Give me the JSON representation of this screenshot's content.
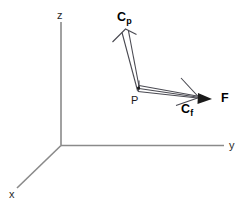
{
  "figure": {
    "title": "",
    "background_color": "#ffffff",
    "axis_color": "#8a8a8a",
    "vector_color": "#4a4a52",
    "label_color": "#111111"
  },
  "axes": [
    {
      "id": "z",
      "label": "z",
      "direction": "up"
    },
    {
      "id": "y",
      "label": "y",
      "direction": "right"
    },
    {
      "id": "x",
      "label": "x",
      "direction": "down-left"
    }
  ],
  "points": [
    {
      "id": "P",
      "label": "P"
    }
  ],
  "vectors": [
    {
      "id": "Cp",
      "label": "C",
      "subscript": "p",
      "head_style": "open",
      "direction": "up-left"
    },
    {
      "id": "Cf",
      "label": "C",
      "subscript": "f",
      "head_style": "open",
      "direction": "right"
    },
    {
      "id": "F",
      "label": "F",
      "subscript": "",
      "head_style": "solid",
      "direction": "right"
    }
  ]
}
